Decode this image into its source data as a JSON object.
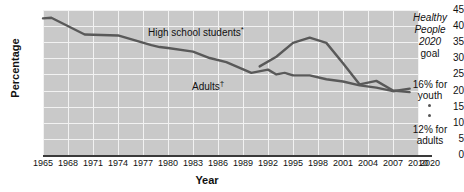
{
  "chart_data": {
    "type": "line",
    "title": "",
    "xlabel": "Year",
    "ylabel": "Percentage",
    "xlim": [
      1965,
      2010
    ],
    "ylim": [
      0,
      45
    ],
    "ytick_labels": [
      "45",
      "40",
      "35",
      "30",
      "25",
      "20",
      "15",
      "10",
      "5",
      "0"
    ],
    "ytick_values": [
      45,
      40,
      35,
      30,
      25,
      20,
      15,
      10,
      5,
      0
    ],
    "xtick_labels": [
      "1965",
      "1968",
      "1971",
      "1974",
      "1977",
      "1980",
      "1983",
      "1986",
      "1989",
      "1992",
      "1995",
      "1998",
      "2001",
      "2004",
      "2007",
      "2010"
    ],
    "xtick_values": [
      1965,
      1968,
      1971,
      1974,
      1977,
      1980,
      1983,
      1986,
      1989,
      1992,
      1995,
      1998,
      2001,
      2004,
      2007,
      2010
    ],
    "detached_xtick_label": "2020",
    "detached_xtick_value": 2020,
    "grid": true,
    "legend_position": "inline-labels",
    "series": [
      {
        "name": "High school students*",
        "label_text": "High school students",
        "label_marker": "*",
        "color": "#595959",
        "x": [
          1991,
          1993,
          1995,
          1997,
          1999,
          2001,
          2003,
          2005,
          2007,
          2009
        ],
        "values": [
          27.5,
          30.5,
          34.8,
          36.4,
          34.8,
          28.5,
          21.9,
          23.0,
          20.0,
          19.5
        ]
      },
      {
        "name": "Adults†",
        "label_text": "Adults",
        "label_marker": "†",
        "color": "#595959",
        "x": [
          1965,
          1966,
          1970,
          1974,
          1978,
          1979,
          1980,
          1983,
          1985,
          1987,
          1990,
          1992,
          1993,
          1994,
          1995,
          1997,
          1999,
          2001,
          2003,
          2005,
          2007,
          2009
        ],
        "values": [
          42.4,
          42.6,
          37.4,
          37.1,
          34.1,
          33.5,
          33.2,
          32.1,
          30.1,
          28.8,
          25.5,
          26.5,
          25.0,
          25.5,
          24.7,
          24.7,
          23.5,
          22.8,
          21.6,
          20.9,
          19.8,
          20.6
        ]
      }
    ],
    "annotations": [
      {
        "id": "healthy-people-goal",
        "lines": [
          "Healthy",
          "People",
          "2020",
          "goal"
        ],
        "italic_lines": 3,
        "style": "italic-heading"
      },
      {
        "id": "youth-target",
        "text": "16% for youth",
        "line1": "16% for",
        "line2": "youth",
        "value": 16,
        "group": "youth"
      },
      {
        "id": "adults-target",
        "text": "12% for adults",
        "line1": "12% for",
        "line2": "adults",
        "value": 12,
        "group": "adults"
      }
    ],
    "colors": {
      "plot_background": "#c9c9c9",
      "gridline": "#f2f2f2",
      "axis": "#3a3a3a",
      "series": "#595959",
      "page_background": "#ffffff",
      "text": "#111111"
    }
  }
}
